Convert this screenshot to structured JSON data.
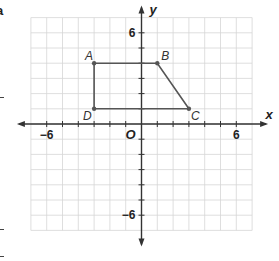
{
  "figure": {
    "type": "coordinate-plane",
    "x_axis_label": "x",
    "y_axis_label": "y",
    "origin_label": "O",
    "x_tick_labels": [
      {
        "value": -6,
        "label": "−6"
      },
      {
        "value": 6,
        "label": "6"
      }
    ],
    "y_tick_labels": [
      {
        "value": 6,
        "label": "6"
      },
      {
        "value": -6,
        "label": "−6"
      }
    ],
    "x_range": [
      -7,
      7
    ],
    "y_range": [
      -7,
      7
    ],
    "grid": true,
    "colors": {
      "grid": "#d6d6d6",
      "axis": "#333333",
      "polygon": "#555555"
    }
  },
  "polygon": {
    "name": "ABCD",
    "vertices": [
      {
        "label": "A",
        "x": -3,
        "y": 4
      },
      {
        "label": "B",
        "x": 1,
        "y": 4
      },
      {
        "label": "C",
        "x": 3,
        "y": 1
      },
      {
        "label": "D",
        "x": -3,
        "y": 1
      }
    ]
  },
  "margin_fragment": {
    "text": "a"
  }
}
